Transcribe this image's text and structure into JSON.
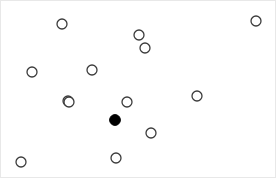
{
  "figure": {
    "title": "",
    "background_color": "#ffffff",
    "border_color": "#e8e8e8",
    "width": 276,
    "height": 178
  },
  "marker_styles": {
    "open": {
      "name": "open-circle",
      "fill": "#ffffff",
      "stroke": "#3c3c3c",
      "stroke_width": 1.3,
      "radius": 5
    },
    "filled": {
      "name": "filled-circle",
      "fill": "#000000",
      "stroke": "#000000",
      "stroke_width": 1,
      "radius": 5.4
    }
  },
  "chart_data": {
    "type": "scatter",
    "title": "",
    "xlabel": "",
    "ylabel": "",
    "xlim": [
      0,
      276
    ],
    "ylim": [
      0,
      178
    ],
    "grid": false,
    "legend": null,
    "axes_visible": false,
    "tick_labels_x": [],
    "tick_labels_y": [],
    "series": [
      {
        "name": "unselected-points",
        "style": "open",
        "count": 13,
        "points": [
          {
            "id": "p1",
            "x": 61,
            "y": 23
          },
          {
            "id": "p2",
            "x": 255,
            "y": 20
          },
          {
            "id": "p3",
            "x": 138,
            "y": 34
          },
          {
            "id": "p4",
            "x": 144,
            "y": 47
          },
          {
            "id": "p5",
            "x": 31,
            "y": 71
          },
          {
            "id": "p6",
            "x": 91,
            "y": 69
          },
          {
            "id": "p7",
            "x": 196,
            "y": 95
          },
          {
            "id": "p8",
            "x": 67,
            "y": 100
          },
          {
            "id": "p9",
            "x": 126,
            "y": 101
          },
          {
            "id": "p10",
            "x": 150,
            "y": 132
          },
          {
            "id": "p11",
            "x": 115,
            "y": 157
          },
          {
            "id": "p12",
            "x": 20,
            "y": 161
          },
          {
            "id": "p13",
            "x": 68,
            "y": 101
          }
        ]
      },
      {
        "name": "highlighted-point",
        "style": "filled",
        "count": 1,
        "points": [
          {
            "id": "h1",
            "x": 114,
            "y": 119
          }
        ]
      }
    ]
  }
}
